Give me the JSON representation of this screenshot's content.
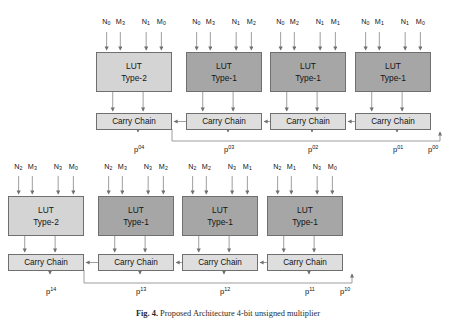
{
  "figure": {
    "caption_label": "Fig. 4.",
    "caption_text": "Proposed Architecture 4-bit unsigned multiplier"
  },
  "blocks": {
    "lut_type1_label_line1": "LUT",
    "lut_type1_label_line2": "Type-1",
    "lut_type2_label_line1": "LUT",
    "lut_type2_label_line2": "Type-2",
    "carry_chain_label": "Carry Chain"
  },
  "colors": {
    "lut_type1_fill": "#a6a6a6",
    "lut_type2_fill": "#d4d4d4",
    "carry_chain_fill": "#dedede",
    "stroke": "#6f6f6f",
    "wire": "#8c8c8c"
  },
  "rows": [
    {
      "name": "row-0",
      "luts": [
        {
          "type": "Type-2",
          "inputs": [
            {
              "base": "N",
              "sub": "0"
            },
            {
              "base": "M",
              "sub": "3"
            },
            {
              "base": "N",
              "sub": "1"
            },
            {
              "base": "M",
              "sub": "0"
            }
          ]
        },
        {
          "type": "Type-1",
          "inputs": [
            {
              "base": "N",
              "sub": "0"
            },
            {
              "base": "M",
              "sub": "3"
            },
            {
              "base": "N",
              "sub": "1"
            },
            {
              "base": "M",
              "sub": "2"
            }
          ]
        },
        {
          "type": "Type-1",
          "inputs": [
            {
              "base": "N",
              "sub": "0"
            },
            {
              "base": "M",
              "sub": "2"
            },
            {
              "base": "N",
              "sub": "1"
            },
            {
              "base": "M",
              "sub": "1"
            }
          ]
        },
        {
          "type": "Type-1",
          "inputs": [
            {
              "base": "N",
              "sub": "0"
            },
            {
              "base": "M",
              "sub": "1"
            },
            {
              "base": "N",
              "sub": "1"
            },
            {
              "base": "M",
              "sub": "0"
            }
          ]
        }
      ],
      "outputs": [
        {
          "base": "p",
          "sup": "04"
        },
        {
          "base": "p",
          "sup": "03"
        },
        {
          "base": "p",
          "sup": "02"
        },
        {
          "base": "p",
          "sup": "01"
        },
        {
          "base": "p",
          "sup": "00"
        }
      ]
    },
    {
      "name": "row-1",
      "luts": [
        {
          "type": "Type-2",
          "inputs": [
            {
              "base": "N",
              "sub": "2"
            },
            {
              "base": "M",
              "sub": "3"
            },
            {
              "base": "N",
              "sub": "3"
            },
            {
              "base": "M",
              "sub": "0"
            }
          ]
        },
        {
          "type": "Type-1",
          "inputs": [
            {
              "base": "N",
              "sub": "2"
            },
            {
              "base": "M",
              "sub": "3"
            },
            {
              "base": "N",
              "sub": "3"
            },
            {
              "base": "M",
              "sub": "2"
            }
          ]
        },
        {
          "type": "Type-1",
          "inputs": [
            {
              "base": "N",
              "sub": "2"
            },
            {
              "base": "M",
              "sub": "2"
            },
            {
              "base": "N",
              "sub": "3"
            },
            {
              "base": "M",
              "sub": "1"
            }
          ]
        },
        {
          "type": "Type-1",
          "inputs": [
            {
              "base": "N",
              "sub": "2"
            },
            {
              "base": "M",
              "sub": "1"
            },
            {
              "base": "N",
              "sub": "3"
            },
            {
              "base": "M",
              "sub": "0"
            }
          ]
        }
      ],
      "outputs": [
        {
          "base": "p",
          "sup": "14"
        },
        {
          "base": "p",
          "sup": "13"
        },
        {
          "base": "p",
          "sup": "12"
        },
        {
          "base": "p",
          "sup": "11"
        },
        {
          "base": "p",
          "sup": "10"
        }
      ]
    }
  ]
}
